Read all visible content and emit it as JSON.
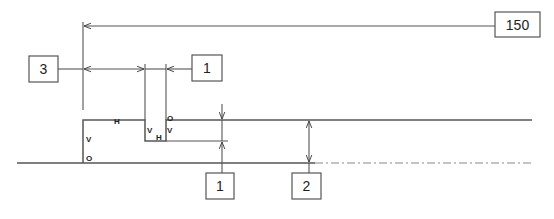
{
  "diagram": {
    "type": "dimensioning-drawing",
    "stroke_color": "#444444",
    "dim_boxes": [
      {
        "id": "dim-150",
        "label": "150",
        "x": 495,
        "y": 12,
        "w": 45,
        "h": 25
      },
      {
        "id": "dim-3",
        "label": "3",
        "x": 29,
        "y": 56,
        "w": 29,
        "h": 26
      },
      {
        "id": "dim-1-top",
        "label": "1",
        "x": 192,
        "y": 55,
        "w": 30,
        "h": 26
      },
      {
        "id": "dim-1-bottom",
        "label": "1",
        "x": 206,
        "y": 173,
        "w": 28,
        "h": 26
      },
      {
        "id": "dim-2",
        "label": "2",
        "x": 292,
        "y": 173,
        "w": 29,
        "h": 26
      }
    ],
    "constraint_tags": [
      {
        "label": "H",
        "x": 114,
        "y": 124
      },
      {
        "label": "V",
        "x": 88,
        "y": 139
      },
      {
        "label": "O",
        "x": 88,
        "y": 160
      },
      {
        "label": "V",
        "x": 150,
        "y": 131
      },
      {
        "label": "H",
        "x": 157,
        "y": 140
      },
      {
        "label": "O",
        "x": 170,
        "y": 119
      },
      {
        "label": "V",
        "x": 170,
        "y": 131
      }
    ]
  }
}
